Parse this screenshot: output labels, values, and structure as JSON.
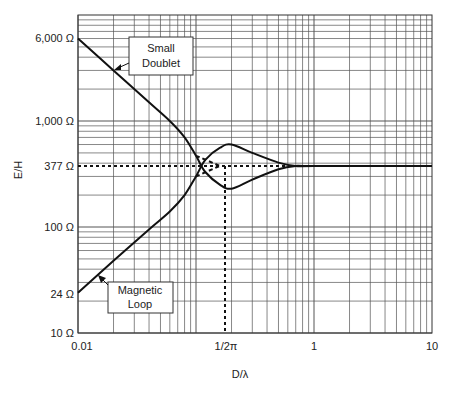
{
  "chart_data": {
    "type": "line",
    "title": "",
    "xlabel": "D/λ",
    "ylabel": "E/H",
    "xscale": "log",
    "yscale": "log",
    "xlim": [
      0.01,
      10
    ],
    "ylim": [
      10,
      10000
    ],
    "grid": true,
    "x_tick_labels": [
      {
        "value": 0.01,
        "label": "0.01"
      },
      {
        "value": 0.159,
        "label": "1/2π"
      },
      {
        "value": 1,
        "label": "1"
      },
      {
        "value": 10,
        "label": "10"
      }
    ],
    "y_tick_labels": [
      {
        "value": 6000,
        "label": "6,000 Ω"
      },
      {
        "value": 1000,
        "label": "1,000 Ω"
      },
      {
        "value": 377,
        "label": "377 Ω"
      },
      {
        "value": 100,
        "label": "100 Ω"
      },
      {
        "value": 24,
        "label": "24 Ω"
      },
      {
        "value": 10,
        "label": "10 Ω"
      }
    ],
    "series": [
      {
        "name": "Small Doublet",
        "style": "solid",
        "x": [
          0.01,
          0.02,
          0.04,
          0.06,
          0.08,
          0.1,
          0.12,
          0.16,
          0.2,
          0.3,
          0.5,
          0.7,
          1,
          10
        ],
        "y": [
          6000,
          3000,
          1500,
          1000,
          700,
          470,
          330,
          250,
          230,
          280,
          350,
          377,
          377,
          377
        ]
      },
      {
        "name": "Magnetic Loop",
        "style": "solid",
        "x": [
          0.01,
          0.02,
          0.04,
          0.06,
          0.08,
          0.1,
          0.12,
          0.16,
          0.2,
          0.3,
          0.5,
          0.7,
          1,
          10
        ],
        "y": [
          24,
          48,
          95,
          140,
          200,
          300,
          430,
          560,
          600,
          500,
          405,
          377,
          377,
          377
        ]
      },
      {
        "name": "Small Doublet (near-field asymptote)",
        "style": "dashed",
        "x": [
          0.1,
          0.159
        ],
        "y": [
          470,
          377
        ]
      },
      {
        "name": "Magnetic Loop (near-field asymptote)",
        "style": "dashed",
        "x": [
          0.1,
          0.159
        ],
        "y": [
          300,
          377
        ]
      },
      {
        "name": "Free-space impedance",
        "style": "dotted",
        "x": [
          0.01,
          0.7
        ],
        "y": [
          377,
          377
        ]
      }
    ],
    "annotations": [
      {
        "text": "Small Doublet",
        "lines": [
          "Small",
          "Doublet"
        ],
        "points_to": {
          "x": 0.02,
          "y": 3000
        }
      },
      {
        "text": "Magnetic Loop",
        "lines": [
          "Magnetic",
          "Loop"
        ],
        "points_to": {
          "x": 0.02,
          "y": 48
        }
      },
      {
        "text": "1/2π transition",
        "x": 0.159,
        "style": "dotted vertical"
      }
    ]
  },
  "labels": {
    "y_axis": "E/H",
    "x_axis": "D/λ",
    "doublet_line1": "Small",
    "doublet_line2": "Doublet",
    "loop_line1": "Magnetic",
    "loop_line2": "Loop",
    "y6000": "6,000 Ω",
    "y1000": "1,000 Ω",
    "y377": "377 Ω",
    "y100": "100 Ω",
    "y24": "24 Ω",
    "y10": "10 Ω",
    "x001": "0.01",
    "x2pi": "1/2π",
    "x1": "1",
    "x10": "10"
  }
}
